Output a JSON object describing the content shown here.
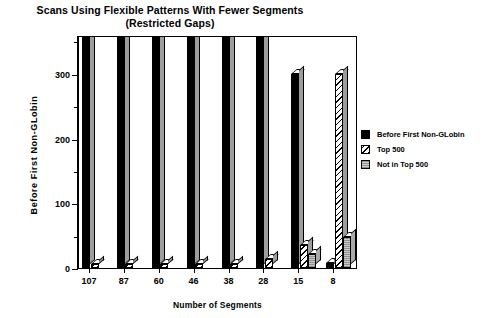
{
  "chart_data": {
    "type": "bar",
    "title": "Scans Using Flexible Patterns With Fewer Segments (Restricted Gaps)",
    "title_line1": "Scans Using Flexible Patterns With Fewer Segments",
    "title_line2": "(Restricted Gaps)",
    "xlabel": "Number of Segments",
    "ylabel": "Before  First  Non-GLobin",
    "categories": [
      "107",
      "87",
      "60",
      "46",
      "38",
      "28",
      "15",
      "8"
    ],
    "ylim": [
      0,
      360
    ],
    "yticks": [
      0,
      100,
      200,
      300
    ],
    "ytick_labels": [
      "0",
      "100",
      "200",
      "300"
    ],
    "yminor_ticks": [
      50,
      150,
      250,
      350
    ],
    "grid": false,
    "legend_position": "right",
    "series": [
      {
        "name": "Before First Non-GLobin",
        "fill": "solid-black",
        "color": "#000000",
        "values": [
          360,
          360,
          360,
          360,
          360,
          360,
          300,
          8
        ]
      },
      {
        "name": "Top 500",
        "fill": "diagonal-hatch",
        "color": "#ffffff",
        "values": [
          6,
          6,
          6,
          6,
          6,
          14,
          35,
          300
        ]
      },
      {
        "name": "Not in Top 500",
        "fill": "light-gray-stipple",
        "color": "#c8c8c8",
        "values": [
          0,
          0,
          0,
          0,
          0,
          0,
          22,
          48
        ]
      }
    ]
  },
  "legend": {
    "items": [
      {
        "label": "Before First Non-GLobin",
        "swatch": "solid-black-swatch"
      },
      {
        "label": "Top 500",
        "swatch": "diagonal-hatch-swatch"
      },
      {
        "label": "Not in Top 500",
        "swatch": "light-gray-swatch"
      }
    ]
  }
}
